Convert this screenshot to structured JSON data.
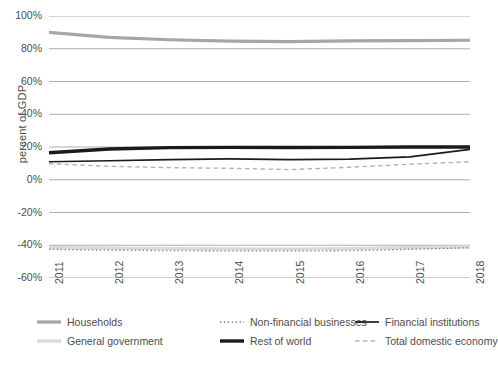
{
  "chart_data": {
    "type": "line",
    "title": "",
    "xlabel": "",
    "ylabel": "percent of GDP",
    "x": [
      "2011",
      "2012",
      "2013",
      "2014",
      "2015",
      "2016",
      "2017",
      "2018"
    ],
    "categories": [
      "2011",
      "2012",
      "2013",
      "2014",
      "2015",
      "2016",
      "2017",
      "2018"
    ],
    "ylim": [
      -60,
      100
    ],
    "yticks": [
      100,
      80,
      60,
      40,
      20,
      0,
      -20,
      -40,
      -60
    ],
    "ytick_labels": [
      "100%",
      "80%",
      "60%",
      "40%",
      "20%",
      "0%",
      "-20%",
      "-40%",
      "-60%"
    ],
    "grid": true,
    "legend_position": "bottom",
    "series": [
      {
        "name": "Households",
        "color": "#a6a6a6",
        "style": "solid",
        "width": 3.2,
        "values": [
          90,
          87,
          85.5,
          84.6,
          84.3,
          84.8,
          85,
          85.2
        ]
      },
      {
        "name": "General government",
        "color": "#d9d9d9",
        "style": "solid",
        "width": 3.2,
        "values": [
          -41.5,
          -41.8,
          -42,
          -42.2,
          -42.3,
          -42,
          -41.5,
          -41
        ]
      },
      {
        "name": "Non-financial businesses",
        "color": "#808080",
        "style": "dotted",
        "width": 1.3,
        "values": [
          -42.5,
          -43,
          -43.3,
          -43.4,
          -43.5,
          -43.3,
          -42.5,
          -41.5
        ]
      },
      {
        "name": "Rest of world",
        "color": "#1a1a1a",
        "style": "solid",
        "width": 3.4,
        "values": [
          16.5,
          18.8,
          19.6,
          19.8,
          19.7,
          19.8,
          20,
          20
        ]
      },
      {
        "name": "Financial institutions",
        "color": "#1a1a1a",
        "style": "solid",
        "width": 1.7,
        "values": [
          11,
          11.6,
          12.3,
          12.7,
          12.3,
          12.6,
          14,
          18.5
        ]
      },
      {
        "name": "Total domestic economy",
        "color": "#b3b3b3",
        "style": "dashed",
        "width": 1.4,
        "values": [
          9.8,
          8.2,
          7.4,
          7,
          6.2,
          7.6,
          9.5,
          11
        ]
      }
    ]
  },
  "legend": {
    "items": [
      {
        "label": "Households",
        "swatch": "solid-thick-gray"
      },
      {
        "label": "Non-financial businesses",
        "swatch": "dotted-gray"
      },
      {
        "label": "Financial institutions",
        "swatch": "solid-thin-black"
      },
      {
        "label": "General government",
        "swatch": "solid-thick-lightgray"
      },
      {
        "label": "Rest of world",
        "swatch": "solid-thick-black"
      },
      {
        "label": "Total domestic economy",
        "swatch": "dashed-gray"
      }
    ]
  },
  "colors": {
    "grid": "#999999",
    "axis_text": "#4d4d4d",
    "background": "#ffffff"
  }
}
